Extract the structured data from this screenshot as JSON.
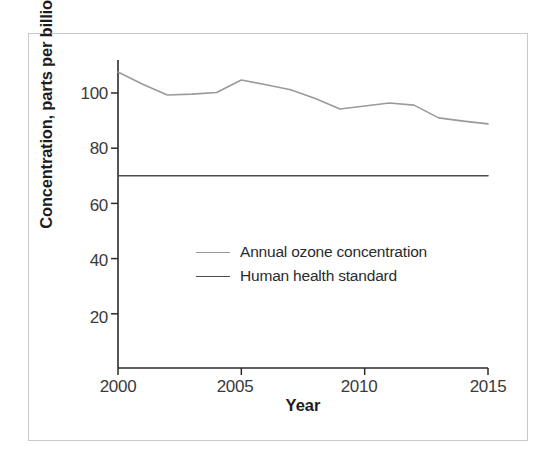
{
  "chart_data": {
    "type": "line",
    "title": "",
    "xlabel": "Year",
    "ylabel": "Concentration, parts per billion",
    "xlim": [
      2000,
      2015
    ],
    "ylim": [
      0,
      112
    ],
    "xticks": [
      2000,
      2005,
      2010,
      2015
    ],
    "yticks": [
      20,
      40,
      60,
      80,
      100
    ],
    "grid": false,
    "legend_position": "center",
    "x": [
      2000,
      2001,
      2002,
      2003,
      2004,
      2005,
      2006,
      2007,
      2008,
      2009,
      2010,
      2011,
      2012,
      2013,
      2014,
      2015
    ],
    "series": [
      {
        "name": "Annual ozone concentration",
        "color": "#9a9a9a",
        "values": [
          107.6,
          103.2,
          99.3,
          99.6,
          100.2,
          104.7,
          103.0,
          101.2,
          98.0,
          94.2,
          95.3,
          96.4,
          95.6,
          91.0,
          89.8,
          88.8
        ]
      },
      {
        "name": "Human health standard",
        "color": "#4d4d4d",
        "values": [
          70,
          70,
          70,
          70,
          70,
          70,
          70,
          70,
          70,
          70,
          70,
          70,
          70,
          70,
          70,
          70
        ]
      }
    ]
  },
  "axes": {
    "y_title": "Concentration, parts per billion",
    "x_title": "Year",
    "y_tick_labels": [
      "100",
      "80",
      "60",
      "40",
      "20"
    ],
    "x_tick_labels": [
      "2000",
      "2005",
      "2010",
      "2015"
    ]
  },
  "legend": {
    "entries": [
      {
        "label": "Annual ozone concentration",
        "color": "#9a9a9a"
      },
      {
        "label": "Human health standard",
        "color": "#4d4d4d"
      }
    ]
  },
  "style": {
    "background": "#ffffff",
    "frame_color": "#c9c9c9",
    "axis_color": "#2b2b2b"
  }
}
